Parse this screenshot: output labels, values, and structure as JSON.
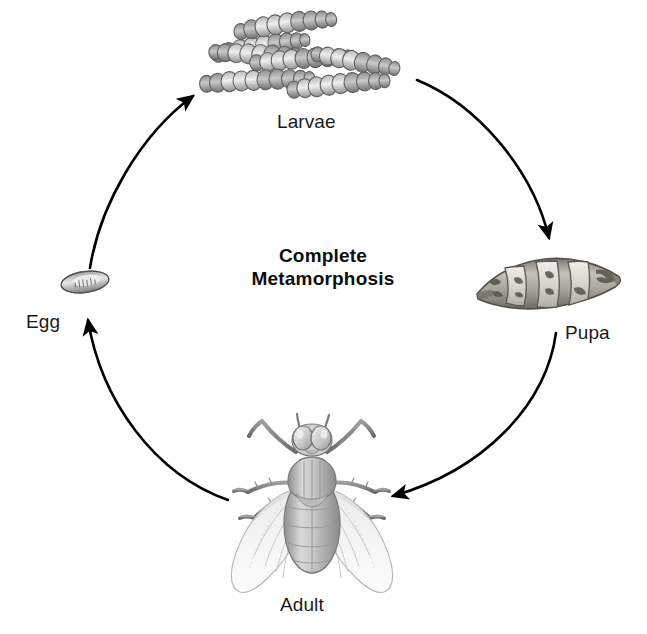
{
  "diagram": {
    "title_line1": "Complete",
    "title_line2": "Metamorphosis",
    "background_color": "#ffffff",
    "text_color": "#1a1a1a",
    "arrow_color": "#000000",
    "stages": [
      {
        "id": "larvae",
        "label": "Larvae",
        "icon": "larvae-cluster-illustration",
        "position": "top"
      },
      {
        "id": "pupa",
        "label": "Pupa",
        "icon": "pupa-illustration",
        "position": "right"
      },
      {
        "id": "adult",
        "label": "Adult",
        "icon": "adult-fly-illustration",
        "position": "bottom"
      },
      {
        "id": "egg",
        "label": "Egg",
        "icon": "egg-illustration",
        "position": "left"
      }
    ],
    "arrows": [
      {
        "id": "egg-to-larvae",
        "from": "Egg",
        "to": "Larvae",
        "direction": "clockwise"
      },
      {
        "id": "larvae-to-pupa",
        "from": "Larvae",
        "to": "Pupa",
        "direction": "clockwise"
      },
      {
        "id": "pupa-to-adult",
        "from": "Pupa",
        "to": "Adult",
        "direction": "clockwise"
      },
      {
        "id": "adult-to-egg",
        "from": "Adult",
        "to": "Egg",
        "direction": "clockwise"
      }
    ],
    "larvae_count": 5,
    "fly_anatomy": {
      "eyes": 2,
      "antennae": 2,
      "wings": 2,
      "legs": 6
    }
  }
}
